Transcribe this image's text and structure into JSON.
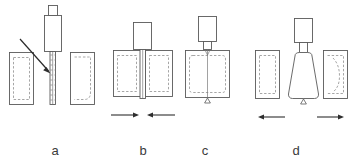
{
  "figure": {
    "type": "technical-process-diagram",
    "background_color": "#ffffff",
    "line_color": "#5a5a5a",
    "dashed_color": "#8f8f8f",
    "arrow_color": "#2e2e2e",
    "label_color": "#3a3a3a",
    "width": 354,
    "height": 168
  },
  "panels": [
    {
      "id": "a",
      "label": "a",
      "label_x": 55,
      "label_y": 155,
      "caption_stage": "plunging",
      "elements": {
        "tool_shank": "rectangle",
        "tool_shoulder": "rectangle",
        "pin": "long vertical pin",
        "left_workpiece": "rectangle with dashed inner outline",
        "right_workpiece": "rectangle with dashed inner outline",
        "pointer_arrow": "diagonal arrow pointing to pin"
      }
    },
    {
      "id": "b",
      "label": "b",
      "label_x": 143,
      "label_y": 155,
      "caption_stage": "workpieces closing",
      "elements": {
        "tool_shoulder": "rectangle",
        "pin": "vertical pin between workpieces",
        "left_workpiece": "rectangle with dashed inner outline",
        "right_workpiece": "rectangle with dashed inner outline",
        "motion_arrow_left": "arrow pointing right",
        "motion_arrow_right": "arrow pointing left"
      }
    },
    {
      "id": "c",
      "label": "c",
      "label_x": 205,
      "label_y": 155,
      "caption_stage": "joined / welded",
      "elements": {
        "tool_shoulder": "rectangle",
        "tool_neck": "small rectangle",
        "pin": "vertical pin through joined block",
        "joined_workpiece": "single rectangle with dashed inner outline",
        "pin_tip": "small triangle at bottom"
      }
    },
    {
      "id": "d",
      "label": "d",
      "label_x": 296,
      "label_y": 155,
      "caption_stage": "separating / retracting",
      "elements": {
        "tool_shank": "rectangle",
        "tool_neck": "small rectangle",
        "weld_nugget": "trapezoid / teardrop body",
        "left_workpiece": "rectangle with dashed inner outline",
        "right_workpiece": "rectangle with dashed inner outline",
        "pin_tip": "small triangle at bottom",
        "motion_arrow_left": "arrow pointing left",
        "motion_arrow_right": "arrow pointing right"
      }
    }
  ]
}
